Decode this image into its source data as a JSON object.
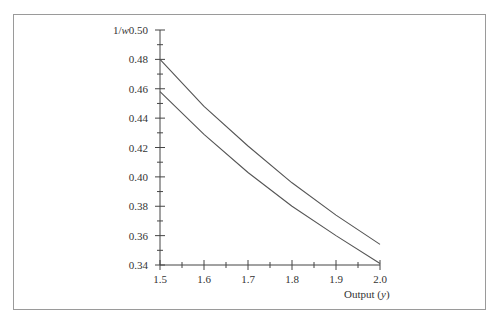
{
  "chart_data": {
    "type": "line",
    "title": "",
    "xlabel": "Output (y)",
    "ylabel": "1/w",
    "xlim": [
      1.5,
      2.0
    ],
    "ylim": [
      0.34,
      0.5
    ],
    "grid": false,
    "legend": null,
    "x_ticks": [
      "1.5",
      "1.6",
      "1.7",
      "1.8",
      "1.9",
      "2.0"
    ],
    "y_ticks": [
      "0.50",
      "0.48",
      "0.46",
      "0.44",
      "0.42",
      "0.40",
      "0.38",
      "0.36",
      "0.34"
    ],
    "x": [
      1.5,
      1.6,
      1.7,
      1.8,
      1.9,
      2.0
    ],
    "series": [
      {
        "name": "upper curve",
        "values": [
          0.48,
          0.448,
          0.421,
          0.396,
          0.374,
          0.354
        ]
      },
      {
        "name": "lower curve",
        "values": [
          0.458,
          0.429,
          0.403,
          0.38,
          0.36,
          0.341
        ]
      }
    ]
  },
  "colors": {
    "line": "#555555",
    "axis": "#444444",
    "frame": "#9a9a9a",
    "text": "#333333"
  }
}
